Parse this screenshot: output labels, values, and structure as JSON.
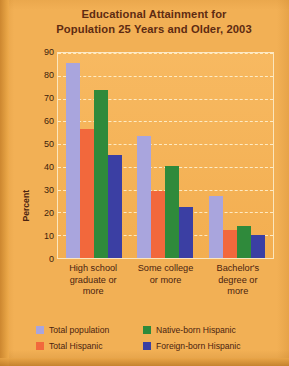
{
  "chart_data": {
    "type": "bar",
    "title": "Educational Attainment for Population 25 Years and Older, 2003",
    "title_lines": [
      "Educational Attainment for",
      "Population 25 Years and Older, 2003"
    ],
    "xlabel": "",
    "ylabel": "Percent",
    "ylim": [
      0,
      90
    ],
    "yticks": [
      90,
      80,
      70,
      60,
      50,
      40,
      30,
      20,
      10,
      0
    ],
    "grid": true,
    "legend_position": "bottom",
    "categories": [
      "High school graduate or more",
      "Some college or more",
      "Bachelor's degree or more"
    ],
    "category_lines": [
      [
        "High school",
        "graduate or",
        "more"
      ],
      [
        "Some college",
        "or more"
      ],
      [
        "Bachelor's",
        "degree or",
        "more"
      ]
    ],
    "series": [
      {
        "name": "Total population",
        "color": "#a9a5dd",
        "values": [
          85,
          53,
          27
        ]
      },
      {
        "name": "Total Hispanic",
        "color": "#f2683c",
        "values": [
          56,
          29,
          12
        ]
      },
      {
        "name": "Native-born Hispanic",
        "color": "#2f8a3b",
        "values": [
          73,
          40,
          14
        ]
      },
      {
        "name": "Foreign-born Hispanic",
        "color": "#3b3fa3",
        "values": [
          45,
          22,
          10
        ]
      }
    ]
  },
  "legend": {
    "entries": [
      {
        "label": "Total population",
        "color": "#a9a5dd"
      },
      {
        "label": "Native-born Hispanic",
        "color": "#2f8a3b"
      },
      {
        "label": "Total Hispanic",
        "color": "#f2683c"
      },
      {
        "label": "Foreign-born Hispanic",
        "color": "#3b3fa3"
      }
    ]
  },
  "colors": {
    "background": "#f2b055",
    "title_text": "#5e2b12",
    "axis_text": "#3d1d0c",
    "plot_border": "#fbe6bd"
  }
}
